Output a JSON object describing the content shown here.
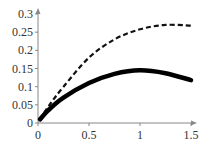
{
  "chart_data": {
    "type": "line",
    "title": "",
    "xlabel": "",
    "ylabel": "",
    "xlim": [
      0,
      1.5
    ],
    "ylim": [
      0,
      0.3
    ],
    "grid": false,
    "legend": null,
    "x_ticks": [
      "0",
      "0.5",
      "1",
      "1.5"
    ],
    "y_ticks": [
      "0",
      "0.05",
      "0.1",
      "0.15",
      "0.2",
      "0.25",
      "0.3"
    ],
    "series": [
      {
        "name": "dashed",
        "style": "dashed",
        "color": "#111111",
        "x": [
          0.02,
          0.1,
          0.25,
          0.5,
          0.75,
          1.0,
          1.25,
          1.5
        ],
        "y": [
          0.01,
          0.045,
          0.1,
          0.18,
          0.23,
          0.258,
          0.27,
          0.268
        ]
      },
      {
        "name": "solid",
        "style": "solid-thick",
        "color": "#000000",
        "x": [
          0.02,
          0.1,
          0.25,
          0.5,
          0.75,
          1.0,
          1.25,
          1.5
        ],
        "y": [
          0.01,
          0.035,
          0.07,
          0.11,
          0.135,
          0.145,
          0.137,
          0.118
        ]
      }
    ]
  }
}
